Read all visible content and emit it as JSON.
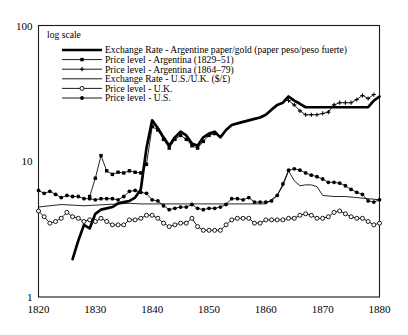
{
  "note": {
    "text": "log scale"
  },
  "axes": {
    "y": {
      "type": "log",
      "ticks": [
        "100",
        "10",
        "1"
      ],
      "tick_values": [
        100,
        10,
        1
      ],
      "range": [
        1,
        100
      ]
    },
    "x": {
      "type": "linear",
      "ticks": [
        "1820",
        "1830",
        "1840",
        "1850",
        "1860",
        "1870",
        "1880"
      ],
      "tick_values": [
        1820,
        1830,
        1840,
        1850,
        1860,
        1870,
        1880
      ],
      "range": [
        1820,
        1880
      ]
    }
  },
  "legend": {
    "entries": [
      {
        "label": "Exchange Rate - Argentine paper/gold (paper peso/peso fuerte)",
        "marker": "none",
        "stroke_width": 2.6
      },
      {
        "label": "Price level - Argentina (1829–51)",
        "marker": "square",
        "stroke_width": 0.9
      },
      {
        "label": "Price level - Argentina (1864–79)",
        "marker": "plus",
        "stroke_width": 0.9
      },
      {
        "label": "Exchange Rate - U.S./U.K. ($/£)",
        "marker": "none",
        "stroke_width": 0.9
      },
      {
        "label": "Price level - U.K.",
        "marker": "circle-open",
        "stroke_width": 0.9
      },
      {
        "label": "Price level - U.S.",
        "marker": "circle-filled",
        "stroke_width": 0.9
      }
    ]
  },
  "chart_data": {
    "type": "line",
    "title": "",
    "xlabel": "",
    "ylabel": "",
    "yscale": "log",
    "ylim": [
      1,
      100
    ],
    "xlim": [
      1820,
      1880
    ],
    "grid": false,
    "legend_position": "top-left-inside",
    "annotation": "log scale",
    "series": [
      {
        "name": "Exchange Rate - Argentine paper/gold (paper peso/peso fuerte)",
        "marker": "none",
        "width": "thick",
        "x": [
          1826,
          1827,
          1828,
          1829,
          1830,
          1831,
          1832,
          1833,
          1834,
          1835,
          1836,
          1837,
          1838,
          1839,
          1840,
          1841,
          1842,
          1843,
          1844,
          1845,
          1846,
          1847,
          1848,
          1849,
          1850,
          1851,
          1852,
          1853,
          1854,
          1855,
          1856,
          1857,
          1858,
          1859,
          1860,
          1861,
          1862,
          1863,
          1864,
          1865,
          1866,
          1867,
          1868,
          1869,
          1870,
          1871,
          1872,
          1873,
          1874,
          1875,
          1876,
          1877,
          1878,
          1879,
          1880
        ],
        "y": [
          1.9,
          2.6,
          3.4,
          3.2,
          4.1,
          4.4,
          4.5,
          4.6,
          4.9,
          5.0,
          5.1,
          5.4,
          6.2,
          12.5,
          20.0,
          17.5,
          15.0,
          13.0,
          15.0,
          16.5,
          15.5,
          13.5,
          13.0,
          15.0,
          16.0,
          16.5,
          15.0,
          17.0,
          18.5,
          19.0,
          19.5,
          20.0,
          20.5,
          21.0,
          22.0,
          24.0,
          26.0,
          27.0,
          30.0,
          28.0,
          26.5,
          25.0,
          25.0,
          25.0,
          25.0,
          25.0,
          25.0,
          25.0,
          25.0,
          25.0,
          25.0,
          25.0,
          25.0,
          28.0,
          30.0
        ]
      },
      {
        "name": "Price level - Argentina (1829–51)",
        "marker": "square",
        "width": "thin",
        "x": [
          1829,
          1830,
          1831,
          1832,
          1833,
          1834,
          1835,
          1836,
          1837,
          1838,
          1839,
          1840,
          1841,
          1842,
          1843,
          1844,
          1845,
          1846,
          1847,
          1848,
          1849,
          1850,
          1851
        ],
        "y": [
          5.5,
          7.5,
          11.0,
          8.5,
          8.0,
          8.3,
          8.2,
          8.5,
          8.3,
          8.2,
          9.5,
          18.0,
          17.0,
          14.5,
          12.5,
          14.5,
          15.5,
          14.5,
          13.0,
          12.5,
          14.0,
          15.5,
          16.0
        ]
      },
      {
        "name": "Price level - Argentina (1864–79)",
        "marker": "plus",
        "width": "thin",
        "x": [
          1864,
          1865,
          1866,
          1867,
          1868,
          1869,
          1870,
          1871,
          1872,
          1873,
          1874,
          1875,
          1876,
          1877,
          1878,
          1879
        ],
        "y": [
          28.0,
          26.0,
          23.5,
          22.0,
          22.0,
          22.0,
          22.5,
          23.0,
          26.0,
          27.0,
          27.0,
          27.0,
          28.5,
          30.5,
          29.0,
          31.0
        ]
      },
      {
        "name": "Exchange Rate - U.S./U.K. ($/£)",
        "marker": "none",
        "width": "thin",
        "x": [
          1820,
          1822,
          1824,
          1826,
          1828,
          1830,
          1832,
          1834,
          1836,
          1838,
          1840,
          1842,
          1844,
          1846,
          1848,
          1850,
          1852,
          1854,
          1856,
          1858,
          1860,
          1862,
          1863,
          1864,
          1865,
          1866,
          1867,
          1868,
          1869,
          1870,
          1872,
          1874,
          1876,
          1878,
          1880
        ],
        "y": [
          4.6,
          4.7,
          4.8,
          4.75,
          4.7,
          4.75,
          4.8,
          4.85,
          4.9,
          4.85,
          4.85,
          4.85,
          4.85,
          4.85,
          4.85,
          4.85,
          4.85,
          4.85,
          4.85,
          4.85,
          4.85,
          5.6,
          6.6,
          8.5,
          7.2,
          6.6,
          6.7,
          6.7,
          6.5,
          5.6,
          5.5,
          5.5,
          5.4,
          5.3,
          5.2
        ]
      },
      {
        "name": "Price level - U.K.",
        "marker": "circle-open",
        "width": "thin",
        "x": [
          1820,
          1821,
          1822,
          1823,
          1824,
          1825,
          1826,
          1827,
          1828,
          1829,
          1830,
          1831,
          1832,
          1833,
          1834,
          1835,
          1836,
          1837,
          1838,
          1839,
          1840,
          1841,
          1842,
          1843,
          1844,
          1845,
          1846,
          1847,
          1848,
          1849,
          1850,
          1851,
          1852,
          1853,
          1854,
          1855,
          1856,
          1857,
          1858,
          1859,
          1860,
          1861,
          1862,
          1863,
          1864,
          1865,
          1866,
          1867,
          1868,
          1869,
          1870,
          1871,
          1872,
          1873,
          1874,
          1875,
          1876,
          1877,
          1878,
          1879,
          1880
        ],
        "y": [
          4.3,
          3.9,
          3.5,
          3.6,
          3.8,
          4.2,
          3.9,
          3.8,
          3.6,
          3.7,
          3.6,
          3.8,
          3.6,
          3.4,
          3.4,
          3.4,
          3.7,
          3.7,
          3.8,
          4.0,
          4.0,
          3.8,
          3.5,
          3.3,
          3.4,
          3.5,
          3.5,
          3.8,
          3.3,
          3.1,
          3.1,
          3.1,
          3.1,
          3.4,
          3.7,
          3.8,
          3.8,
          3.8,
          3.5,
          3.5,
          3.7,
          3.7,
          3.7,
          3.7,
          3.8,
          3.8,
          4.0,
          4.1,
          4.0,
          3.8,
          3.8,
          3.9,
          4.2,
          4.3,
          4.1,
          3.9,
          3.8,
          3.8,
          3.6,
          3.4,
          3.5
        ]
      },
      {
        "name": "Price level - U.S.",
        "marker": "circle-filled",
        "width": "thin",
        "x": [
          1820,
          1821,
          1822,
          1823,
          1824,
          1825,
          1826,
          1827,
          1828,
          1829,
          1830,
          1831,
          1832,
          1833,
          1834,
          1835,
          1836,
          1837,
          1838,
          1839,
          1840,
          1841,
          1842,
          1843,
          1844,
          1845,
          1846,
          1847,
          1848,
          1849,
          1850,
          1851,
          1852,
          1853,
          1854,
          1855,
          1856,
          1857,
          1858,
          1859,
          1860,
          1861,
          1862,
          1863,
          1864,
          1865,
          1866,
          1867,
          1868,
          1869,
          1870,
          1871,
          1872,
          1873,
          1874,
          1875,
          1876,
          1877,
          1878,
          1879,
          1880
        ],
        "y": [
          6.1,
          5.8,
          6.0,
          5.7,
          5.4,
          5.6,
          5.5,
          5.5,
          5.3,
          5.3,
          5.2,
          5.3,
          5.3,
          5.3,
          5.2,
          5.5,
          6.0,
          6.1,
          5.9,
          5.8,
          5.2,
          5.1,
          4.7,
          4.4,
          4.5,
          4.6,
          4.6,
          4.8,
          4.5,
          4.4,
          4.5,
          4.5,
          4.6,
          4.8,
          5.3,
          5.3,
          5.2,
          5.4,
          5.0,
          5.0,
          5.0,
          5.1,
          5.6,
          6.8,
          8.6,
          8.8,
          8.6,
          8.2,
          7.9,
          7.7,
          7.4,
          7.0,
          7.0,
          6.9,
          6.6,
          6.2,
          5.9,
          5.7,
          5.1,
          5.0,
          5.2
        ]
      }
    ]
  }
}
